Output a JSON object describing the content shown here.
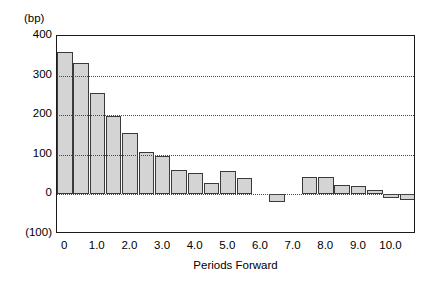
{
  "chart_data": {
    "type": "bar",
    "title": "",
    "unit_note": "(bp)",
    "xlabel": "Periods  Forward",
    "ylabel": "",
    "ylim": [
      -100,
      400
    ],
    "yticks": [
      400,
      300,
      200,
      100,
      0,
      -100
    ],
    "ytick_labels": [
      "400",
      "300",
      "200",
      "100",
      "0",
      "(100)"
    ],
    "xlim": [
      -0.5,
      10.5
    ],
    "xticks": [
      0,
      1,
      2,
      3,
      4,
      5,
      6,
      7,
      8,
      9,
      10
    ],
    "xtick_labels": [
      "0",
      "1.0",
      "2.0",
      "3.0",
      "4.0",
      "5.0",
      "6.0",
      "7.0",
      "8.0",
      "9.0",
      "10.0"
    ],
    "grid": true,
    "grid_style": "dotted-horizontal",
    "legend": null,
    "bar_fill_color": "#d4d4d4",
    "bar_edge_color": "#3a3a3a",
    "x": [
      0,
      0.4,
      0.8,
      1.3,
      1.7,
      2.1,
      2.5,
      2.9,
      3.3,
      3.7,
      4.1,
      4.5,
      4.9,
      5.4,
      5.8,
      6.3,
      6.7,
      7.1,
      7.6,
      8.0,
      8.4,
      8.8,
      9.3,
      9.7
    ],
    "categories": [
      "0",
      "0.4",
      "0.8",
      "1.3",
      "1.7",
      "2.1",
      "2.5",
      "2.9",
      "3.3",
      "3.7",
      "4.1",
      "4.5",
      "4.9",
      "5.4",
      "5.8",
      "6.3",
      "6.7",
      "7.1",
      "7.6",
      "8.0",
      "8.4",
      "8.8",
      "9.3",
      "9.7"
    ],
    "values": [
      360,
      332,
      255,
      197,
      155,
      107,
      98,
      62,
      55,
      28,
      58,
      42,
      0,
      -20,
      45,
      45,
      25,
      22,
      12,
      -8,
      -14,
      0,
      0,
      0
    ]
  },
  "bars": [
    {
      "name": "bar-1",
      "x_left": 0.0,
      "x_right": 0.95,
      "value": 360
    },
    {
      "name": "bar-2",
      "x_left": 1.0,
      "x_right": 1.95,
      "value": 332
    },
    {
      "name": "bar-3",
      "x_left": 2.0,
      "x_right": 2.95,
      "value": 255
    },
    {
      "name": "bar-4",
      "x_left": 3.0,
      "x_right": 3.95,
      "value": 197
    },
    {
      "name": "bar-5",
      "x_left": 4.0,
      "x_right": 4.95,
      "value": 155
    },
    {
      "name": "bar-6",
      "x_left": 5.0,
      "x_right": 5.95,
      "value": 107
    },
    {
      "name": "bar-7",
      "x_left": 6.0,
      "x_right": 6.95,
      "value": 98
    },
    {
      "name": "bar-8",
      "x_left": 7.0,
      "x_right": 7.95,
      "value": 62
    },
    {
      "name": "bar-9",
      "x_left": 8.0,
      "x_right": 8.95,
      "value": 55
    },
    {
      "name": "bar-10",
      "x_left": 9.0,
      "x_right": 9.95,
      "value": 28
    },
    {
      "name": "bar-11",
      "x_left": 10.0,
      "x_right": 10.95,
      "value": 58
    },
    {
      "name": "bar-12",
      "x_left": 11.0,
      "x_right": 11.95,
      "value": 42
    },
    {
      "name": "bar-13",
      "x_left": 13.0,
      "x_right": 13.95,
      "value": -20
    },
    {
      "name": "bar-14",
      "x_left": 15.0,
      "x_right": 15.95,
      "value": 45
    },
    {
      "name": "bar-15",
      "x_left": 16.0,
      "x_right": 16.95,
      "value": 45
    },
    {
      "name": "bar-16",
      "x_left": 17.0,
      "x_right": 17.95,
      "value": 25
    },
    {
      "name": "bar-17",
      "x_left": 18.0,
      "x_right": 18.95,
      "value": 22
    },
    {
      "name": "bar-18",
      "x_left": 19.0,
      "x_right": 19.95,
      "value": 12
    },
    {
      "name": "bar-19",
      "x_left": 20.0,
      "x_right": 20.95,
      "value": -8
    },
    {
      "name": "bar-20",
      "x_left": 21.0,
      "x_right": 21.95,
      "value": -14
    }
  ]
}
